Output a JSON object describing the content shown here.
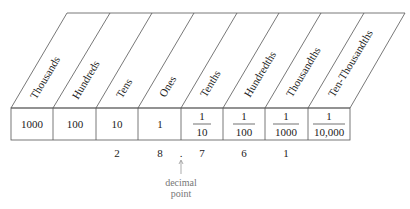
{
  "diagram": {
    "columns": [
      {
        "header": "Thousands",
        "value": "1000",
        "fraction": false
      },
      {
        "header": "Hundreds",
        "value": "100",
        "fraction": false
      },
      {
        "header": "Tens",
        "value": "10",
        "fraction": false
      },
      {
        "header": "Ones",
        "value": "1",
        "fraction": false
      },
      {
        "header": "Tenths",
        "num": "1",
        "den": "10",
        "fraction": true
      },
      {
        "header": "Hundredths",
        "num": "1",
        "den": "100",
        "fraction": true
      },
      {
        "header": "Thousandths",
        "num": "1",
        "den": "1000",
        "fraction": true
      },
      {
        "header": "Ten-Thousandths",
        "num": "1",
        "den": "10,000",
        "fraction": true
      }
    ],
    "digits": [
      {
        "column": "Tens",
        "digit": "2"
      },
      {
        "column": "Ones",
        "digit": "8"
      },
      {
        "column": "Tenths",
        "digit": "7"
      },
      {
        "column": "Hundredths",
        "digit": "6"
      },
      {
        "column": "Thousandths",
        "digit": "1"
      }
    ],
    "decimal_point_mark": ".",
    "annotation": {
      "line1": "decimal",
      "line2": "point"
    },
    "colors": {
      "lines": "#555555",
      "text": "#222222",
      "annotation": "#777777"
    }
  }
}
